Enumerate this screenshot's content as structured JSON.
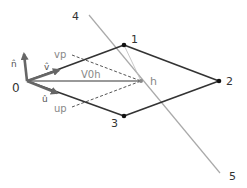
{
  "diagram": {
    "type": "geometry-vector-diagram",
    "colors": {
      "background": "#ffffff",
      "polygon_edge": "#333333",
      "vertex": "#111111",
      "vector": "#666666",
      "dashed": "#555555",
      "cut_line": "#aaaaaa",
      "label_dark": "#333333",
      "label_gray": "#888888"
    },
    "points": [
      {
        "id": "0",
        "label": "0",
        "x": 27,
        "y": 81
      },
      {
        "id": "1",
        "label": "1",
        "x": 124,
        "y": 45
      },
      {
        "id": "2",
        "label": "2",
        "x": 219,
        "y": 81
      },
      {
        "id": "3",
        "label": "3",
        "x": 124,
        "y": 116
      },
      {
        "id": "h",
        "label": "h",
        "x": 141,
        "y": 81
      }
    ],
    "line_endpoints": [
      {
        "id": "4",
        "label": "4",
        "x": 89,
        "y": 15
      },
      {
        "id": "5",
        "label": "5",
        "x": 220,
        "y": 173
      }
    ],
    "vectors": [
      {
        "id": "n",
        "label": "n̂",
        "from": "0",
        "to_x": 24,
        "to_y": 52
      },
      {
        "id": "v",
        "label": "v̂",
        "from": "0",
        "to_x": 61,
        "to_y": 69
      },
      {
        "id": "u",
        "label": "û",
        "from": "0",
        "to_x": 59,
        "to_y": 94
      }
    ],
    "segments": [
      {
        "id": "V0h",
        "label": "V0h",
        "style": "solid-gray"
      },
      {
        "id": "vp",
        "label": "vp",
        "style": "dashed"
      },
      {
        "id": "up",
        "label": "up",
        "style": "dashed"
      }
    ]
  }
}
